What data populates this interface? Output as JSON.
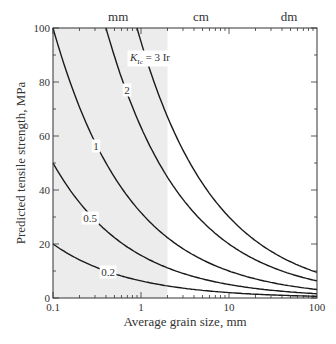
{
  "chart_data": {
    "type": "line",
    "title": "",
    "xlabel": "Average grain size, mm",
    "ylabel": "Predicted tensile strength, MPa",
    "xscale": "log",
    "xlim": [
      0.1,
      100
    ],
    "ylim": [
      0,
      100
    ],
    "x_ticks": [
      0.1,
      1,
      10,
      100
    ],
    "x_tick_labels": [
      "0.1",
      "1",
      "10",
      "100"
    ],
    "y_ticks": [
      0,
      20,
      40,
      60,
      80,
      100
    ],
    "y_tick_labels": [
      "0",
      "20",
      "40",
      "60",
      "80",
      "100"
    ],
    "top_axis_labels": [
      {
        "text": "mm",
        "x": 0.55
      },
      {
        "text": "cm",
        "x": 4.8
      },
      {
        "text": "dm",
        "x": 48
      }
    ],
    "shaded_region": {
      "x_from": 0.1,
      "x_to": 2,
      "color": "#ececec"
    },
    "grid": false,
    "legend": "inline curve labels",
    "model": "strength = 31.62 * K / sqrt(grain_size)",
    "series": [
      {
        "name": "K_Ic = 3 Ir",
        "label": "K",
        "label_sub": "Ic",
        "label_rest": " = 3 Ir",
        "K": 3,
        "x": [
          0.9,
          1,
          2,
          5,
          10,
          20,
          50,
          100
        ],
        "values": [
          100,
          94.9,
          67.1,
          42.4,
          30.0,
          21.2,
          13.4,
          9.5
        ],
        "label_pos": [
          150,
          61
        ]
      },
      {
        "name": "2",
        "label": "2",
        "K": 2,
        "x": [
          0.4,
          0.5,
          1,
          2,
          5,
          10,
          20,
          50,
          100
        ],
        "values": [
          100,
          89.4,
          63.2,
          44.7,
          28.3,
          20.0,
          14.1,
          8.9,
          6.3
        ],
        "label_pos": [
          127,
          94
        ]
      },
      {
        "name": "1",
        "label": "1",
        "K": 1,
        "x": [
          0.1,
          0.2,
          0.5,
          1,
          2,
          5,
          10,
          20,
          50,
          100
        ],
        "values": [
          100,
          70.7,
          44.7,
          31.6,
          22.4,
          14.1,
          10.0,
          7.1,
          4.5,
          3.2
        ],
        "label_pos": [
          96,
          150
        ]
      },
      {
        "name": "0.5",
        "label": "0.5",
        "K": 0.5,
        "x": [
          0.1,
          0.2,
          0.5,
          1,
          2,
          5,
          10,
          20,
          50,
          100
        ],
        "values": [
          50.0,
          35.4,
          22.4,
          15.8,
          11.2,
          7.1,
          5.0,
          3.5,
          2.2,
          1.6
        ],
        "label_pos": [
          90,
          222
        ]
      },
      {
        "name": "0.2",
        "label": "0.2",
        "K": 0.2,
        "x": [
          0.1,
          0.2,
          0.5,
          1,
          2,
          5,
          10,
          20,
          50,
          100
        ],
        "values": [
          20.0,
          14.1,
          8.9,
          6.3,
          4.5,
          2.8,
          2.0,
          1.4,
          0.9,
          0.6
        ],
        "label_pos": [
          108,
          276
        ]
      }
    ],
    "colors": {
      "line": "#1a1a1a",
      "axis": "#333333",
      "shade": "#ececec"
    }
  }
}
